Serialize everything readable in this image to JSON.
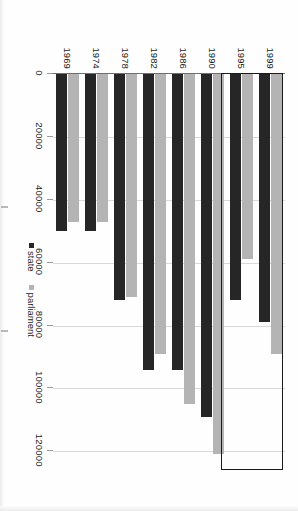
{
  "chart_data": {
    "type": "bar",
    "orientation": "horizontal",
    "title": "",
    "xlabel": "",
    "ylabel": "",
    "categories": [
      "1999",
      "1995",
      "1990",
      "1986",
      "1982",
      "1978",
      "1974",
      "1969"
    ],
    "series": [
      {
        "name": "parliament",
        "color": "#b4b4b4",
        "values": [
          89000,
          59000,
          121000,
          105000,
          89000,
          71000,
          47000,
          47000
        ]
      },
      {
        "name": "state",
        "color": "#262626",
        "values": [
          79000,
          72000,
          109000,
          94000,
          94000,
          72000,
          50000,
          50000
        ]
      }
    ],
    "xticks": [
      0,
      20000,
      40000,
      60000,
      80000,
      100000,
      120000
    ],
    "xticklabels": [
      "0",
      "20000",
      "40000",
      "60000",
      "80000",
      "100000",
      "120000"
    ],
    "xlim": [
      0,
      125000
    ],
    "grid": true,
    "legend_position": "bottom-right",
    "annotations": [
      {
        "kind": "highlight-rectangle",
        "covers": [
          "1999",
          "1995"
        ],
        "stroke": "#1a1a1a"
      }
    ]
  },
  "legend": {
    "items": [
      {
        "label": "state",
        "color": "#262626"
      },
      {
        "label": "parliament",
        "color": "#b4b4b4"
      }
    ]
  },
  "axis": {
    "category_labels": [
      "1999",
      "1995",
      "1990",
      "1986",
      "1982",
      "1978",
      "1974",
      "1969"
    ],
    "value_labels": [
      "0",
      "20000",
      "40000",
      "60000",
      "80000",
      "100000",
      "120000"
    ]
  }
}
